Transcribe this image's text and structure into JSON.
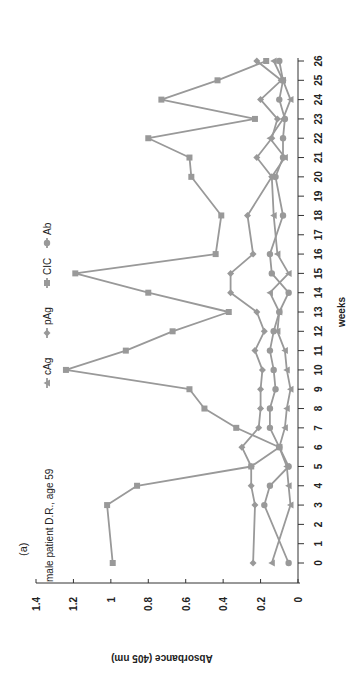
{
  "figure": {
    "panel_label": "(a)",
    "annotation": "male patient D.R., age 59",
    "orientation": "rotated-90-clockwise"
  },
  "colors": {
    "series": "#999999",
    "axis": "#333333",
    "text": "#222222"
  },
  "chart_data": {
    "type": "line",
    "title": "",
    "annotation": "male patient D.R., age 59",
    "panel": "(a)",
    "xlabel": "weeks",
    "ylabel": "Absorbance (405 nm)",
    "xlim": [
      -1,
      26
    ],
    "ylim": [
      0,
      1.4
    ],
    "x_ticks": [
      0,
      1,
      2,
      3,
      4,
      5,
      6,
      7,
      8,
      9,
      10,
      11,
      12,
      13,
      14,
      15,
      16,
      17,
      18,
      19,
      20,
      21,
      22,
      23,
      24,
      25,
      26
    ],
    "y_ticks": [
      0,
      0.2,
      0.4,
      0.6,
      0.8,
      1,
      1.2,
      1.4
    ],
    "y_tick_labels": [
      "0",
      "0.2",
      "0.4",
      "0.6",
      "0.8",
      "1",
      "1.2",
      "1.4"
    ],
    "grid": false,
    "legend_position": "top",
    "legend": [
      "cAg",
      "pAg",
      "CIC",
      "Ab"
    ],
    "series": [
      {
        "name": "cAg",
        "marker": "triangle",
        "x": [
          0,
          3,
          4,
          5,
          6,
          7,
          8,
          9,
          10,
          11,
          12,
          13,
          14,
          15,
          16,
          18,
          20,
          21,
          22,
          23,
          24,
          25,
          26
        ],
        "values": [
          0.14,
          0.04,
          0.05,
          0.06,
          0.1,
          0.07,
          0.06,
          0.04,
          0.06,
          0.07,
          0.11,
          0.1,
          0.15,
          0.05,
          0.11,
          0.13,
          0.14,
          0.07,
          0.15,
          0.08,
          0.04,
          0.08,
          0.13
        ]
      },
      {
        "name": "pAg",
        "marker": "diamond",
        "x": [
          0,
          3,
          4,
          5,
          6,
          7,
          8,
          9,
          10,
          11,
          12,
          13,
          14,
          15,
          16,
          18,
          20,
          21,
          22,
          23,
          24,
          25,
          26
        ],
        "values": [
          0.24,
          0.23,
          0.25,
          0.25,
          0.3,
          0.21,
          0.2,
          0.2,
          0.19,
          0.23,
          0.18,
          0.22,
          0.36,
          0.36,
          0.24,
          0.27,
          0.14,
          0.22,
          0.14,
          0.11,
          0.2,
          0.09,
          0.22
        ]
      },
      {
        "name": "CIC",
        "marker": "square",
        "x": [
          0,
          3,
          4,
          5,
          6,
          7,
          8,
          9,
          10,
          11,
          12,
          13,
          14,
          15,
          16,
          18,
          20,
          21,
          22,
          23,
          24,
          25,
          26
        ],
        "values": [
          0.99,
          1.02,
          0.86,
          0.25,
          0.1,
          0.33,
          0.5,
          0.58,
          1.24,
          0.92,
          0.67,
          0.37,
          0.8,
          1.19,
          0.44,
          0.41,
          0.57,
          0.58,
          0.8,
          0.23,
          0.73,
          0.43,
          0.17
        ]
      },
      {
        "name": "Ab",
        "marker": "circle",
        "x": [
          0,
          3,
          4,
          5,
          6,
          7,
          8,
          9,
          10,
          11,
          12,
          13,
          14,
          15,
          16,
          18,
          20,
          21,
          22,
          23,
          24,
          25,
          26
        ],
        "values": [
          0.05,
          0.18,
          0.15,
          0.05,
          0.1,
          0.15,
          0.15,
          0.12,
          0.13,
          0.15,
          0.13,
          0.1,
          0.05,
          0.14,
          0.15,
          0.08,
          0.12,
          0.08,
          0.08,
          0.07,
          0.1,
          0.08,
          0.1
        ]
      }
    ]
  }
}
